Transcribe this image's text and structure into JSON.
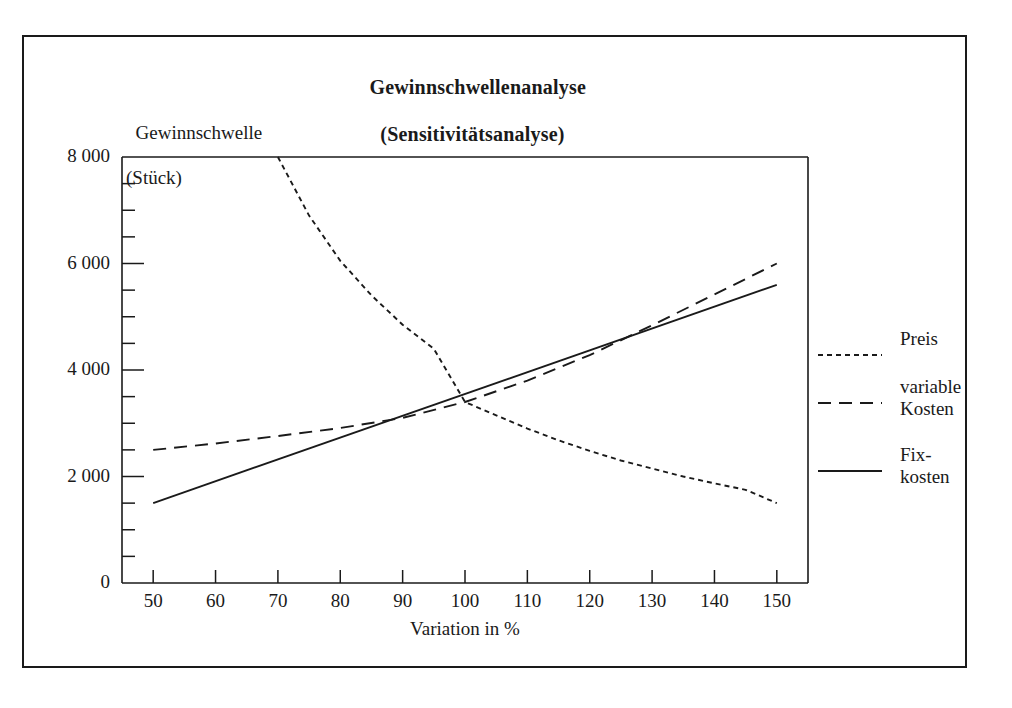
{
  "chart_data": {
    "type": "line",
    "title": "Gewinnschwellenanalyse",
    "subtitle": "(Sensitivitätsanalyse)",
    "ylabel_line1": "Gewinnschwelle",
    "ylabel_line2": "(Stück)",
    "xlabel": "Variation in %",
    "xlim": [
      45,
      155
    ],
    "ylim": [
      0,
      8000
    ],
    "grid": false,
    "legend_position": "right-outside",
    "x_ticks": [
      50,
      60,
      70,
      80,
      90,
      100,
      110,
      120,
      130,
      140,
      150
    ],
    "x_tick_labels": [
      "50",
      "60",
      "70",
      "80",
      "90",
      "100",
      "110",
      "120",
      "130",
      "140",
      "150"
    ],
    "y_ticks": [
      0,
      2000,
      4000,
      6000,
      8000
    ],
    "y_tick_labels": [
      "0",
      "2 000",
      "4 000",
      "6 000",
      "8 000"
    ],
    "y_minor_tick_step": 500,
    "series": [
      {
        "name": "Preis",
        "style": "dotted",
        "x": [
          70,
          75,
          80,
          85,
          90,
          95,
          100,
          105,
          110,
          115,
          120,
          125,
          130,
          135,
          140,
          145,
          150
        ],
        "values": [
          8000,
          6900,
          6050,
          5400,
          4850,
          4400,
          3400,
          3150,
          2900,
          2680,
          2480,
          2300,
          2150,
          2000,
          1870,
          1750,
          1500
        ]
      },
      {
        "name": "variable Kosten",
        "style": "dashed",
        "x": [
          50,
          60,
          70,
          80,
          90,
          100,
          110,
          120,
          130,
          140,
          150
        ],
        "values": [
          2500,
          2620,
          2760,
          2910,
          3100,
          3400,
          3800,
          4280,
          4840,
          5420,
          6000
        ]
      },
      {
        "name": "Fixkosten",
        "style": "solid",
        "x": [
          50,
          150
        ],
        "values": [
          1500,
          5600
        ]
      }
    ]
  },
  "legend": {
    "entries": [
      {
        "label_line1": "Preis",
        "label_line2": "",
        "style": "dotted"
      },
      {
        "label_line1": "variable",
        "label_line2": "Kosten",
        "style": "dashed"
      },
      {
        "label_line1": "Fix-",
        "label_line2": "kosten",
        "style": "solid"
      }
    ]
  },
  "colors": {
    "line": "#1a1a1a",
    "background": "#ffffff",
    "frame": "#1a1a1a"
  }
}
